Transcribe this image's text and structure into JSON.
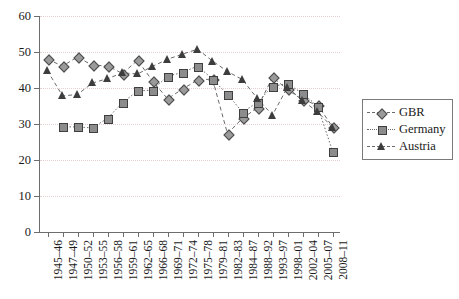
{
  "chart_data": {
    "type": "line",
    "title": "",
    "xlabel": "",
    "ylabel": "",
    "ylim": [
      0,
      60
    ],
    "yticks": [
      0,
      10,
      20,
      30,
      40,
      50,
      60
    ],
    "grid": "horizontal-dotted",
    "legend_position": "right",
    "categories": [
      "1945–46",
      "1947–49",
      "1950–52",
      "1953–55",
      "1956–58",
      "1959–61",
      "1962–65",
      "1966–68",
      "1969–71",
      "1972–74",
      "1975–78",
      "1979–81",
      "1982–83",
      "1984–87",
      "1988–92",
      "1993–97",
      "1998–01",
      "2002–04",
      "2005–07",
      "2008–11"
    ],
    "series": [
      {
        "name": "GBR",
        "marker": "diamond",
        "line": "dashed",
        "values": [
          48.0,
          46.1,
          48.6,
          46.3,
          46.2,
          44.0,
          47.7,
          42.0,
          37.0,
          39.7,
          42.2,
          42.5,
          27.3,
          31.6,
          34.5,
          43.0,
          39.6,
          36.7,
          35.3,
          29.2
        ]
      },
      {
        "name": "Germany",
        "marker": "square",
        "line": "dotted",
        "values": [
          null,
          29.2,
          29.2,
          28.9,
          31.6,
          35.9,
          39.2,
          39.4,
          43.3,
          44.3,
          46.1,
          42.5,
          38.2,
          33.3,
          36.0,
          40.5,
          41.2,
          38.5,
          35.0,
          22.5
        ]
      },
      {
        "name": "Austria",
        "marker": "triangle",
        "line": "dashed",
        "values": [
          44.8,
          37.8,
          38.2,
          41.4,
          42.6,
          44.2,
          43.9,
          46.0,
          48.0,
          49.4,
          50.8,
          47.5,
          44.6,
          42.3,
          37.0,
          32.5,
          40.2,
          36.5,
          33.4,
          29.1
        ]
      }
    ],
    "colors": {
      "gbr_marker_fill": "#9a9a9a",
      "germany_marker_fill": "#8c8c8c",
      "austria_marker_fill": "#3d3d3d",
      "line": "#6a6a6a",
      "axis": "#6d6d6d",
      "gridline": "#e8cfcf"
    }
  },
  "legend": {
    "items": [
      {
        "label": "GBR",
        "marker": "diamond"
      },
      {
        "label": "Germany",
        "marker": "square"
      },
      {
        "label": "Austria",
        "marker": "triangle"
      }
    ]
  }
}
